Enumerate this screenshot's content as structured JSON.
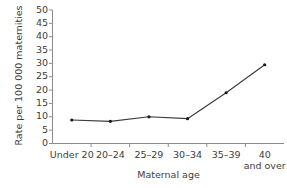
{
  "chart_data": {
    "type": "line",
    "title": "",
    "subtitle": "",
    "xlabel": "Maternal age",
    "ylabel": "Rate per 100 000 maternities",
    "categories": [
      "Under 20",
      "20–24",
      "25–29",
      "30–34",
      "35–39",
      "40 and over"
    ],
    "category_lines": [
      [
        "Under 20"
      ],
      [
        "20–24"
      ],
      [
        "25–29"
      ],
      [
        "30–34"
      ],
      [
        "35–39"
      ],
      [
        "40",
        "and over"
      ]
    ],
    "values": [
      8.8,
      8.3,
      10.0,
      9.3,
      19.0,
      29.5
    ],
    "ylim": [
      0,
      50
    ],
    "ytick_step": 5,
    "yticks": [
      0,
      5,
      10,
      15,
      20,
      25,
      30,
      35,
      40,
      45,
      50
    ],
    "ytick_labels": [
      "0",
      "5",
      "10",
      "15",
      "20",
      "25",
      "30",
      "35",
      "40",
      "45",
      "50"
    ],
    "grid": false,
    "legend": false,
    "legend_position": "none",
    "marker": "dot",
    "line_color": "#3a3a3a",
    "marker_color": "#1a1a1a",
    "axis_color": "#8c8c8c",
    "background": "#ffffff"
  }
}
